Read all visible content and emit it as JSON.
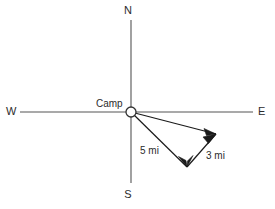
{
  "diagram": {
    "background_color": "#ffffff",
    "line_color": "#1a1a1a",
    "axis_color": "#555555",
    "label_color": "#2b2b2b",
    "compass": {
      "north": "N",
      "south": "S",
      "east": "E",
      "west": "W"
    },
    "origin": {
      "label": "Camp",
      "x": 131,
      "y": 112
    },
    "vectors": [
      {
        "name": "leg-one",
        "label": "5 mi",
        "magnitude": 5,
        "units": "mi",
        "from_x": 131,
        "from_y": 112,
        "to_x": 187,
        "to_y": 167,
        "label_x": 140,
        "label_y": 154
      },
      {
        "name": "leg-two",
        "label": "3 mi",
        "magnitude": 3,
        "units": "mi",
        "from_x": 187,
        "from_y": 167,
        "to_x": 216,
        "to_y": 134,
        "label_x": 206,
        "label_y": 159
      },
      {
        "name": "resultant",
        "label": "",
        "from_x": 131,
        "from_y": 112,
        "to_x": 216,
        "to_y": 134
      }
    ],
    "axes": {
      "horizontal": {
        "x1": 20,
        "y1": 112,
        "x2": 253,
        "y2": 112
      },
      "vertical": {
        "x1": 131,
        "y1": 20,
        "x2": 131,
        "y2": 183
      }
    },
    "compass_label_positions": {
      "north": {
        "x": 128,
        "y": 14
      },
      "south": {
        "x": 128,
        "y": 198
      },
      "west": {
        "x": 6,
        "y": 114
      },
      "east": {
        "x": 258,
        "y": 114
      }
    },
    "origin_label_position": {
      "x": 96,
      "y": 107
    }
  }
}
